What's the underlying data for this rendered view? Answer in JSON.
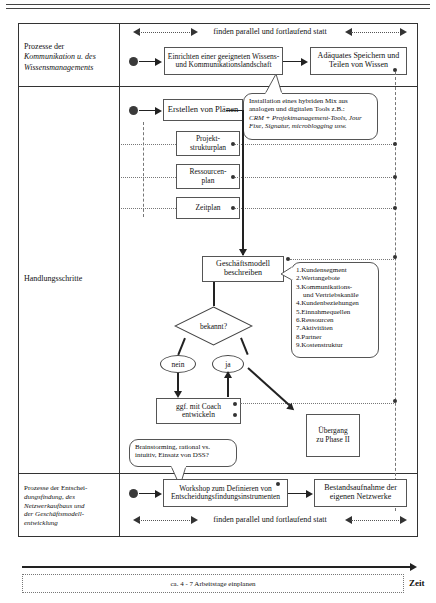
{
  "diagram": {
    "title_rows": {
      "row1_label_line1": "Prozesse der",
      "row1_label_line2": "Kommunikation u. des",
      "row1_label_line3": "Wissensmanagements",
      "row2_label": "Handlungsschritte",
      "row3_label_line1": "Prozesse der Entschei-",
      "row3_label_line2": "dungsfindung, des",
      "row3_label_line3": "Netzwerkaufbaus und",
      "row3_label_line4": "der Geschäftsmodell-",
      "row3_label_line5": "entwicklung"
    },
    "banners": {
      "top": "finden parallel und fortlaufend statt",
      "bottom": "finden parallel und fortlaufend statt"
    },
    "nodes": {
      "kommunikationslandschaft_l1": "Einrichten einer geeigneten Wissens-",
      "kommunikationslandschaft_l2": "und Kommunikationslandschaft",
      "speichern_l1": "Adäquates Speichern und",
      "speichern_l2": "Teilen von Wissen",
      "plaene": "Erstellen von Plänen",
      "projektstrukturplan_l1": "Projekt-",
      "projektstrukturplan_l2": "strukturplan",
      "ressourcenplan_l1": "Ressourcen-",
      "ressourcenplan_l2": "plan",
      "zeitplan": "Zeitplan",
      "geschaeftsmodell_l1": "Geschäftsmodell",
      "geschaeftsmodell_l2": "beschreiben",
      "decision": "bekannt?",
      "branch_no": "nein",
      "branch_yes": "ja",
      "coach_l1": "ggf. mit Coach",
      "coach_l2": "entwickeln",
      "uebergang_l1": "Übergang",
      "uebergang_l2": "zu Phase II",
      "workshop_l1": "Workshop zum Definieren von",
      "workshop_l2": "Entscheidungsfindungsinstrumenten",
      "bestandsaufnahme_l1": "Bestandsaufnahme der",
      "bestandsaufnahme_l2": "eigenen Netzwerke"
    },
    "callouts": {
      "tools_l1": "Installation eines hybriden Mix aus",
      "tools_l2": "analogen und digitalen Tools z.B.:",
      "tools_l3": "CRM + Projektmanagement-Tools, Jour",
      "tools_l4": "Fixe, Signatur, microblogging usw.",
      "brainstorming_l1": "Brainstorming, rational vs.",
      "brainstorming_l2": "intuitiv, Einsatz von DSS?"
    },
    "bmc_list": {
      "title": "",
      "items": [
        "1.Kundensegment",
        "2.Wertangebote",
        "3.Kommunikations-",
        "und Vertriebskanäle",
        "4.Kundenbeziehungen",
        "5.Einnahmequellen",
        "6.Ressourcen",
        "7.Aktivitäten",
        "8.Partner",
        "9.Kostenstruktur"
      ]
    },
    "timeline": {
      "duration": "ca. 4 - 7 Arbeitstage einplanen",
      "axis_label": "Zeit"
    },
    "colors": {
      "stroke": "#333333",
      "text": "#111111",
      "dotted": "#777777",
      "dot_marker": "#3a3a3a"
    }
  }
}
